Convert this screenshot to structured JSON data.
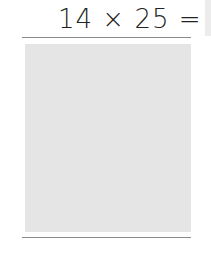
{
  "problem": {
    "expression": "14 × 25 =",
    "operand_a": "14",
    "operator": "×",
    "operand_b": "25",
    "equals": "="
  },
  "answer_area": {
    "value": ""
  }
}
